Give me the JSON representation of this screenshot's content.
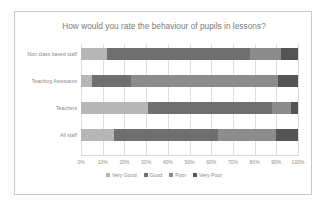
{
  "chart_data": {
    "type": "bar",
    "orientation": "horizontal",
    "stacked": "100%",
    "title": "How would you rate the behaviour of pupils in lessons?",
    "xlabel": "",
    "ylabel": "",
    "xlim": [
      0,
      100
    ],
    "grid": true,
    "legend_position": "bottom",
    "categories": [
      "Non class based staff",
      "Teaching Assistants",
      "Teachers",
      "All staff"
    ],
    "tick_labels": [
      "0%",
      "10%",
      "20%",
      "30%",
      "40%",
      "50%",
      "60%",
      "70%",
      "80%",
      "90%",
      "100%"
    ],
    "tick_values": [
      0,
      10,
      20,
      30,
      40,
      50,
      60,
      70,
      80,
      90,
      100
    ],
    "series": [
      {
        "name": "Very Good",
        "color": "#b6b6b6",
        "values": [
          12,
          5,
          31,
          15
        ]
      },
      {
        "name": "Good",
        "color": "#6f6f6f",
        "values": [
          66,
          18,
          57,
          48
        ]
      },
      {
        "name": "Poor",
        "color": "#8c8c8c",
        "values": [
          14,
          68,
          9,
          27
        ]
      },
      {
        "name": "Very Poor",
        "color": "#545454",
        "values": [
          8,
          9,
          3,
          10
        ]
      }
    ]
  },
  "colors": {
    "chart_border": "#c9c9c9",
    "gridline": "#dedede",
    "title_text": "#7b7b7b",
    "label_text": "#8a8a8a",
    "background": "#ffffff"
  }
}
